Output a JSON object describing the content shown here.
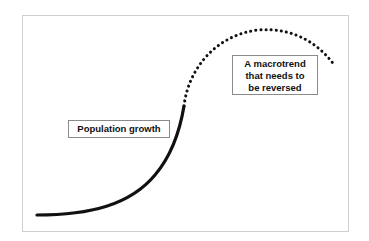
{
  "diagram": {
    "labels": {
      "population_growth": "Population growth",
      "macrotrend": "A macrotrend\nthat needs to\nbe reversed"
    },
    "curves": {
      "solid": {
        "description": "Historical population growth (solid line)",
        "color": "#111111",
        "path": "M37,215 C90,215 130,205 155,175 C172,155 180,130 184,106"
      },
      "dotted": {
        "description": "Projected trend (dotted line)",
        "color": "#111111",
        "path": "M184,106 C188,70 215,35 258,30 C295,27 320,45 335,66"
      }
    },
    "colors": {
      "frame_border": "#cfcfcf",
      "label_border": "#8a8a8a",
      "text": "#111111",
      "background": "#ffffff"
    }
  }
}
